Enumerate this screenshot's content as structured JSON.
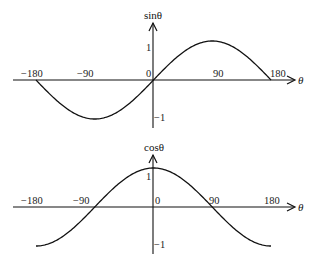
{
  "chart_data": [
    {
      "type": "line",
      "title": "",
      "ylabel": "sinθ",
      "xlabel": "θ",
      "x_ticks": [
        "-180",
        "-90",
        "0",
        "90",
        "180"
      ],
      "y_ticks": [
        "1",
        "-1"
      ],
      "xlim": [
        -180,
        180
      ],
      "ylim": [
        -1,
        1
      ],
      "grid": false,
      "series": [
        {
          "name": "sinθ",
          "x": [
            -180,
            -135,
            -90,
            -45,
            0,
            45,
            90,
            135,
            180
          ],
          "values": [
            0,
            -0.71,
            -1,
            -0.71,
            0,
            0.71,
            1,
            0.71,
            0
          ]
        }
      ]
    },
    {
      "type": "line",
      "title": "",
      "ylabel": "cosθ",
      "xlabel": "θ",
      "x_ticks": [
        "-180",
        "-90",
        "0",
        "90",
        "180"
      ],
      "y_ticks": [
        "1",
        "-1"
      ],
      "xlim": [
        -180,
        180
      ],
      "ylim": [
        -1,
        1
      ],
      "grid": false,
      "series": [
        {
          "name": "cosθ",
          "x": [
            -180,
            -135,
            -90,
            -45,
            0,
            45,
            90,
            135,
            180
          ],
          "values": [
            -1,
            -0.71,
            0,
            0.71,
            1,
            0.71,
            0,
            -0.71,
            -1
          ]
        }
      ]
    }
  ],
  "sin_chart": {
    "ylabel": "sinθ",
    "xlabel": "θ",
    "ticks": {
      "m180": "−180",
      "m90": "−90",
      "zero": "0",
      "p90": "90",
      "p180": "180"
    },
    "y1": "1",
    "ym1": "−1"
  },
  "cos_chart": {
    "ylabel": "cosθ",
    "xlabel": "θ",
    "ticks": {
      "m180": "−180",
      "m90": "−90",
      "zero": "0",
      "p90": "90",
      "p180": "180"
    },
    "y1": "1",
    "ym1": "−1"
  },
  "colors": {
    "line": "#111111",
    "background": "#ffffff"
  }
}
